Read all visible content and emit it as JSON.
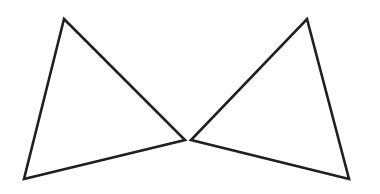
{
  "figure": {
    "background_color": "#ffffff",
    "width": 380,
    "height": 194,
    "stroke_color": "#1f1f1f",
    "stroke_width": 2.6,
    "fill": "none",
    "shapes": [
      {
        "name": "left-triangle",
        "type": "triangle",
        "points": "64,19 185,140 24,179",
        "vertices": [
          {
            "label": "apex-top",
            "x": 64,
            "y": 19
          },
          {
            "label": "apex-right",
            "x": 185,
            "y": 140
          },
          {
            "label": "apex-bottom-left",
            "x": 24,
            "y": 179
          }
        ]
      },
      {
        "name": "right-triangle",
        "type": "triangle",
        "points": "307,19 349,179 191,140",
        "vertices": [
          {
            "label": "apex-top",
            "x": 307,
            "y": 19
          },
          {
            "label": "apex-bottom-right",
            "x": 349,
            "y": 179
          },
          {
            "label": "apex-left",
            "x": 191,
            "y": 140
          }
        ]
      }
    ]
  }
}
